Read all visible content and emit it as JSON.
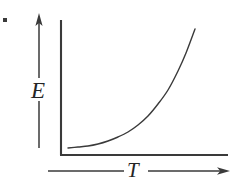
{
  "figure": {
    "kind": "line-plot-schematic",
    "background_color": "#ffffff",
    "ink_color": "#3a3a3a",
    "label_color": "#252525",
    "bullet_marker": {
      "name": "item-bullet",
      "shape": "square-dot",
      "x": 5,
      "y": 20,
      "size": 4
    },
    "y_axis": {
      "label": "E",
      "label_text": "E",
      "axis_line": {
        "x": 61,
        "y_top": 20,
        "y_bottom": 155
      },
      "pointer_arrow": {
        "x": 39,
        "y_top": 13,
        "y_bottom": 148,
        "gap_top": 78,
        "gap_bottom": 101,
        "direction": "up"
      }
    },
    "x_axis": {
      "label": "T",
      "label_text": "T",
      "axis_line": {
        "y": 155,
        "x_left": 61,
        "x_right": 228
      },
      "pointer_arrow": {
        "y": 171,
        "x_left": 48,
        "x_right": 230,
        "gap_left": 124,
        "gap_right": 148,
        "direction": "right"
      }
    }
  },
  "chart_data": {
    "type": "line",
    "title": "",
    "subtitle": "",
    "xlabel": "T",
    "ylabel": "E",
    "legend": [],
    "legend_position": "none",
    "grid": false,
    "axis_ticks": false,
    "tick_labels": {
      "x": [],
      "y": []
    },
    "xlim": [
      0,
      1
    ],
    "ylim": [
      0,
      1
    ],
    "annotations": [],
    "series": [
      {
        "name": "E(T)",
        "color": "#3a3a3a",
        "width": 1.4,
        "x": [
          0.0,
          0.08,
          0.16,
          0.24,
          0.32,
          0.4,
          0.48,
          0.56,
          0.64,
          0.72,
          0.8,
          0.88,
          0.94,
          1.0
        ],
        "y": [
          0.0,
          0.01,
          0.02,
          0.04,
          0.06,
          0.09,
          0.13,
          0.19,
          0.26,
          0.36,
          0.49,
          0.67,
          0.82,
          1.0
        ],
        "pixel_points": [
          [
            68,
            148
          ],
          [
            78,
            147
          ],
          [
            88,
            146
          ],
          [
            98,
            144
          ],
          [
            108,
            141
          ],
          [
            118,
            137
          ],
          [
            128,
            132
          ],
          [
            138,
            125
          ],
          [
            148,
            116
          ],
          [
            158,
            104
          ],
          [
            168,
            90
          ],
          [
            178,
            71
          ],
          [
            186,
            53
          ],
          [
            195,
            29
          ]
        ]
      }
    ]
  }
}
